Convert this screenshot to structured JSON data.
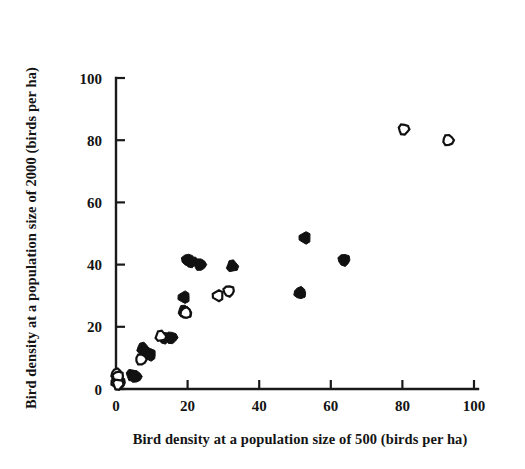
{
  "figure": {
    "background_color": "#ffffff",
    "marker_color": "#111111",
    "axis_color": "#1a1a1a"
  },
  "chart_data": {
    "type": "scatter",
    "title": "",
    "xlabel": "Bird density at a population size of 500 (birds per ha)",
    "ylabel": "Bird density at a population size of 2000 (birds per ha)",
    "xlim": [
      0,
      100
    ],
    "ylim": [
      0,
      100
    ],
    "xticks": [
      0,
      20,
      40,
      60,
      80,
      100
    ],
    "yticks": [
      0,
      20,
      40,
      60,
      80,
      100
    ],
    "xtick_labels": [
      "0",
      "20",
      "40",
      "60",
      "80",
      "100"
    ],
    "ytick_labels": [
      "0",
      "20",
      "40",
      "60",
      "80",
      "100"
    ],
    "grid": false,
    "legend": false,
    "legend_position": "none",
    "series": [
      {
        "name": "filled-circles",
        "marker": "filled-circle",
        "color": "#111111",
        "points": [
          [
            0.5,
            3.5
          ],
          [
            1.0,
            2.0
          ],
          [
            4.5,
            4.5
          ],
          [
            5.5,
            4.0
          ],
          [
            7.5,
            13.0
          ],
          [
            8.5,
            11.5
          ],
          [
            9.5,
            11.0
          ],
          [
            13.5,
            16.5
          ],
          [
            15.5,
            16.5
          ],
          [
            19.0,
            25.0
          ],
          [
            19.5,
            24.5
          ],
          [
            19.0,
            29.5
          ],
          [
            20.0,
            41.5
          ],
          [
            21.0,
            41.0
          ],
          [
            23.5,
            40.0
          ],
          [
            32.5,
            39.5
          ],
          [
            51.4,
            30.9
          ],
          [
            52.8,
            48.6
          ],
          [
            63.7,
            41.5
          ]
        ]
      },
      {
        "name": "open-circles",
        "marker": "open-circle",
        "color": "#ffffff",
        "points": [
          [
            0.2,
            4.8
          ],
          [
            0.2,
            2.0
          ],
          [
            0.6,
            4.0
          ],
          [
            0.6,
            1.5
          ],
          [
            7.0,
            9.5
          ],
          [
            12.5,
            17.0
          ],
          [
            19.5,
            24.5
          ],
          [
            28.5,
            30.0
          ],
          [
            31.5,
            31.5
          ],
          [
            80.4,
            83.5
          ],
          [
            92.8,
            80.0
          ]
        ]
      }
    ]
  },
  "axes": {
    "x_title": "Bird density at a population size of 500 (birds per ha)",
    "y_title": "Bird density at a population size of 2000 (birds per ha)"
  }
}
